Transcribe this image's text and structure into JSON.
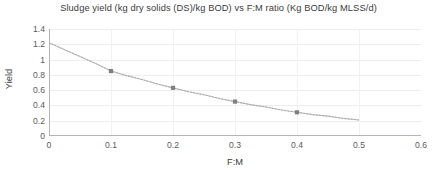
{
  "chart_data": {
    "type": "scatter",
    "title": "Sludge yield (kg dry solids (DS)/kg BOD) vs F:M ratio (Kg BOD/kg MLSS/d)",
    "xlabel": "F:M",
    "ylabel": "Yield",
    "xlim": [
      0,
      0.6
    ],
    "ylim": [
      0,
      1.4
    ],
    "xticks": [
      "0",
      "0.1",
      "0.2",
      "0.3",
      "0.4",
      "0.5",
      "0.6"
    ],
    "xtick_values": [
      0,
      0.1,
      0.2,
      0.3,
      0.4,
      0.5,
      0.6
    ],
    "yticks": [
      "0",
      "0.2",
      "0.4",
      "0.6",
      "0.8",
      "1",
      "1.2",
      "1.4"
    ],
    "ytick_values": [
      0,
      0.2,
      0.4,
      0.6,
      0.8,
      1.0,
      1.2,
      1.4
    ],
    "grid": true,
    "grid_axis": "both",
    "legend": false,
    "series": [
      {
        "name": "Sludge yield",
        "marker": "square",
        "marker_color": "#808080",
        "x": [
          0.1,
          0.2,
          0.3,
          0.4
        ],
        "values": [
          0.85,
          0.63,
          0.45,
          0.31
        ]
      }
    ],
    "trendline": {
      "style": "dotted",
      "color": "#c4c4c4",
      "x_start": 0.0,
      "x_end": 0.5,
      "y_start": 1.22,
      "y_end": 0.21,
      "points": [
        [
          0.0,
          1.22
        ],
        [
          0.025,
          1.13
        ],
        [
          0.05,
          1.04
        ],
        [
          0.075,
          0.95
        ],
        [
          0.1,
          0.85
        ],
        [
          0.125,
          0.79
        ],
        [
          0.15,
          0.74
        ],
        [
          0.175,
          0.68
        ],
        [
          0.2,
          0.63
        ],
        [
          0.225,
          0.58
        ],
        [
          0.25,
          0.54
        ],
        [
          0.275,
          0.49
        ],
        [
          0.3,
          0.45
        ],
        [
          0.325,
          0.41
        ],
        [
          0.35,
          0.38
        ],
        [
          0.375,
          0.34
        ],
        [
          0.4,
          0.31
        ],
        [
          0.425,
          0.28
        ],
        [
          0.45,
          0.26
        ],
        [
          0.475,
          0.23
        ],
        [
          0.5,
          0.21
        ]
      ]
    },
    "colors": {
      "axis": "#b0b0b0",
      "grid": "#ededed",
      "marker": "#808080",
      "trendline": "#c9c9c9",
      "text": "#4a4a4a",
      "background": "#ffffff"
    }
  }
}
